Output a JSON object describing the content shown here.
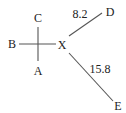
{
  "diagram": {
    "type": "distance-diagram",
    "line_color": "#555555",
    "text_color": "#222222",
    "nodes": {
      "A": {
        "label": "A"
      },
      "B": {
        "label": "B"
      },
      "C": {
        "label": "C"
      },
      "X": {
        "label": "X"
      },
      "D": {
        "label": "D"
      },
      "E": {
        "label": "E"
      }
    },
    "edges": [
      {
        "from": "X",
        "to": "D",
        "label": "8.2"
      },
      {
        "from": "X",
        "to": "E",
        "label": "15.8"
      }
    ],
    "cross": {
      "description": "cross at A-B-C with horizontal arm pointing to X"
    }
  }
}
